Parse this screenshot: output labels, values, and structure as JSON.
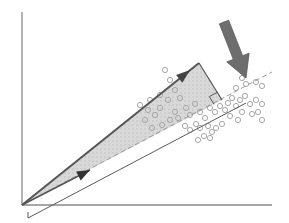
{
  "diagram": {
    "title": "",
    "colors": {
      "background": "#ffffff",
      "axis": "#8a8a8a",
      "vector": "#555555",
      "projection_line": "#9a9a9a",
      "shaded_region": "#d4d4d4",
      "points": "#a8a8a8",
      "big_arrow": "#6e6e6e",
      "offset_line": "#5a5a5a"
    },
    "origin": [
      22,
      205
    ],
    "axes": {
      "y_axis": {
        "x": 22,
        "y_top": 12,
        "y_bottom": 205
      },
      "x_axis": {
        "y": 205,
        "x_left": 22,
        "x_right": 272
      }
    },
    "vector_tip": [
      199,
      63
    ],
    "projection_direction_end": [
      272,
      72
    ],
    "projection_foot": [
      222,
      100
    ],
    "projected_arrow_tip": [
      90,
      170
    ],
    "offset_line": {
      "start": [
        28,
        218
      ],
      "end": [
        246,
        103
      ]
    },
    "big_arrow": {
      "from": [
        224,
        22
      ],
      "to": [
        246,
        78
      ]
    },
    "points": [
      [
        165,
        70
      ],
      [
        170,
        80
      ],
      [
        175,
        90
      ],
      [
        160,
        95
      ],
      [
        168,
        100
      ],
      [
        180,
        98
      ],
      [
        186,
        108
      ],
      [
        175,
        112
      ],
      [
        190,
        115
      ],
      [
        195,
        104
      ],
      [
        200,
        112
      ],
      [
        205,
        118
      ],
      [
        196,
        124
      ],
      [
        185,
        126
      ],
      [
        178,
        118
      ],
      [
        170,
        120
      ],
      [
        160,
        108
      ],
      [
        155,
        115
      ],
      [
        148,
        110
      ],
      [
        140,
        105
      ],
      [
        150,
        100
      ],
      [
        145,
        120
      ],
      [
        152,
        128
      ],
      [
        162,
        125
      ],
      [
        190,
        130
      ],
      [
        200,
        128
      ],
      [
        208,
        126
      ],
      [
        212,
        132
      ],
      [
        210,
        108
      ],
      [
        215,
        112
      ],
      [
        220,
        106
      ],
      [
        225,
        110
      ],
      [
        228,
        103
      ],
      [
        232,
        98
      ],
      [
        236,
        106
      ],
      [
        240,
        100
      ],
      [
        245,
        96
      ],
      [
        250,
        104
      ],
      [
        256,
        100
      ],
      [
        262,
        104
      ],
      [
        258,
        112
      ],
      [
        262,
        120
      ],
      [
        252,
        114
      ],
      [
        242,
        112
      ],
      [
        238,
        120
      ],
      [
        230,
        116
      ],
      [
        222,
        124
      ],
      [
        216,
        128
      ],
      [
        210,
        138
      ],
      [
        204,
        136
      ],
      [
        198,
        140
      ],
      [
        246,
        84
      ],
      [
        256,
        82
      ],
      [
        262,
        86
      ],
      [
        236,
        88
      ],
      [
        242,
        78
      ]
    ]
  }
}
